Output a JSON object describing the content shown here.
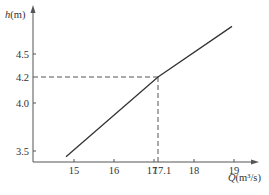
{
  "chart_data": {
    "type": "line",
    "title": "",
    "xlabel_var": "Q",
    "xlabel_unit": "(m³/s)",
    "ylabel_var": "h",
    "ylabel_unit": "(m)",
    "x_ticks": [
      {
        "value": 15,
        "label": "15"
      },
      {
        "value": 16,
        "label": "16"
      },
      {
        "value": 17,
        "label": "17"
      },
      {
        "value": 17.1,
        "label": "17.1"
      },
      {
        "value": 18,
        "label": "18"
      },
      {
        "value": 19,
        "label": "19"
      }
    ],
    "y_ticks": [
      {
        "value": 3.5,
        "label": "3.5"
      },
      {
        "value": 4.0,
        "label": "4.0"
      },
      {
        "value": 4.2,
        "label": "4.2"
      },
      {
        "value": 4.5,
        "label": "4.5"
      }
    ],
    "xlim": [
      13.8,
      19.6
    ],
    "ylim": [
      3.4,
      4.98
    ],
    "grid": false,
    "series": [
      {
        "name": "h-Q relation",
        "points": [
          {
            "x": 14.8,
            "y": 3.44
          },
          {
            "x": 17.1,
            "y": 4.2
          },
          {
            "x": 18.95,
            "y": 4.86
          }
        ]
      }
    ],
    "annotations": [
      {
        "type": "dashed-guide",
        "x": 17.1,
        "y": 4.2
      }
    ]
  }
}
